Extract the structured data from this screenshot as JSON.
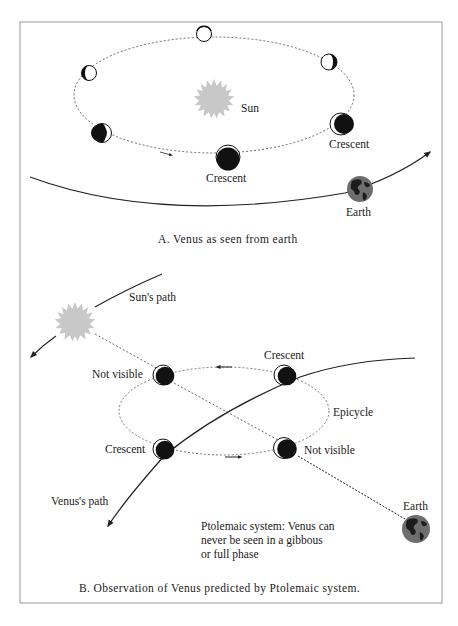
{
  "panel_a": {
    "caption": "A.  Venus as seen from earth",
    "labels": {
      "sun": "Sun",
      "crescent_right": "Crescent",
      "crescent_bottom": "Crescent",
      "earth": "Earth"
    },
    "venus_phases": [
      {
        "position": "top",
        "phase": "full"
      },
      {
        "position": "upper-left",
        "phase": "gibbous"
      },
      {
        "position": "upper-right",
        "phase": "gibbous"
      },
      {
        "position": "lower-left",
        "phase": "crescent"
      },
      {
        "position": "lower-right",
        "phase": "crescent"
      },
      {
        "position": "bottom",
        "phase": "new/crescent"
      }
    ]
  },
  "panel_b": {
    "caption": "B.  Observation of Venus predicted by Ptolemaic system.",
    "labels": {
      "suns_path": "Sun's path",
      "not_visible_left": "Not visible",
      "crescent_top": "Crescent",
      "epicycle": "Epicycle",
      "crescent_left": "Crescent",
      "not_visible_right": "Not visible",
      "venus_path": "Venus's path",
      "earth": "Earth"
    },
    "note_lines": [
      "Ptolemaic system: Venus can",
      "never be seen in a gibbous",
      "or full phase"
    ]
  },
  "colors": {
    "sun": "#c8c8c8",
    "venus_dark": "#111111",
    "earth_ocean": "#6e6e6e",
    "earth_land": "#1c1c1c",
    "frame": "#9a9a9a",
    "line": "#222222"
  }
}
